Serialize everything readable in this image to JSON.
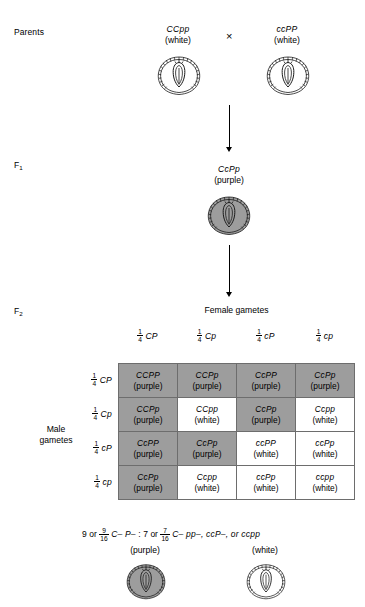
{
  "figure": {
    "type": "punnett-square-dihybrid-cross"
  },
  "generations": {
    "parents_label": "Parents",
    "f1_label": "F",
    "f1_sub": "1",
    "f2_label": "F",
    "f2_sub": "2"
  },
  "parents": {
    "left": {
      "genotype": "CCpp",
      "phenotype": "(white)",
      "shaded": false
    },
    "cross_symbol": "×",
    "right": {
      "genotype": "ccPP",
      "phenotype": "(white)",
      "shaded": false
    }
  },
  "f1": {
    "genotype": "CcPp",
    "phenotype": "(purple)",
    "shaded": true
  },
  "punnett": {
    "column_axis_title": "Female gametes",
    "row_axis_title_line1": "Male",
    "row_axis_title_line2": "gametes",
    "fraction_numerator": "1",
    "fraction_denominator": "4",
    "column_gametes": [
      "CP",
      "Cp",
      "cP",
      "cp"
    ],
    "row_gametes": [
      "CP",
      "Cp",
      "cP",
      "cp"
    ],
    "cells": [
      [
        {
          "genotype": "CCPP",
          "phenotype": "(purple)",
          "shaded": true
        },
        {
          "genotype": "CCPp",
          "phenotype": "(purple)",
          "shaded": true
        },
        {
          "genotype": "CcPP",
          "phenotype": "(purple)",
          "shaded": true
        },
        {
          "genotype": "CcPp",
          "phenotype": "(purple)",
          "shaded": true
        }
      ],
      [
        {
          "genotype": "CCPp",
          "phenotype": "(purple)",
          "shaded": true
        },
        {
          "genotype": "CCpp",
          "phenotype": "(white)",
          "shaded": false
        },
        {
          "genotype": "CcPp",
          "phenotype": "(purple)",
          "shaded": true
        },
        {
          "genotype": "Ccpp",
          "phenotype": "(white)",
          "shaded": false
        }
      ],
      [
        {
          "genotype": "CcPP",
          "phenotype": "(purple)",
          "shaded": true
        },
        {
          "genotype": "CcPp",
          "phenotype": "(purple)",
          "shaded": true
        },
        {
          "genotype": "ccPP",
          "phenotype": "(white)",
          "shaded": false
        },
        {
          "genotype": "ccPp",
          "phenotype": "(white)",
          "shaded": false
        }
      ],
      [
        {
          "genotype": "CcPp",
          "phenotype": "(purple)",
          "shaded": true
        },
        {
          "genotype": "Ccpp",
          "phenotype": "(white)",
          "shaded": false
        },
        {
          "genotype": "ccPp",
          "phenotype": "(white)",
          "shaded": false
        },
        {
          "genotype": "ccpp",
          "phenotype": "(white)",
          "shaded": false
        }
      ]
    ]
  },
  "summary": {
    "purple_count": "9",
    "purple_or": "or",
    "purple_num": "9",
    "purple_den": "16",
    "purple_genotypes": "C– P–",
    "separator": ":",
    "white_count": "7",
    "white_or": "or",
    "white_num": "7",
    "white_den": "16",
    "white_genotypes": "C– pp–, ccP–, or ccpp",
    "purple_phenotype": "(purple)",
    "white_phenotype": "(white)"
  },
  "colors": {
    "shaded_cell": "#9d9d9d",
    "plain_cell": "#ffffff",
    "grid_border": "#6d6d6d",
    "text": "#000000",
    "kernel_shaded_fill": "#9d9d9d",
    "kernel_plain_fill": "#ffffff"
  },
  "icons": {
    "kernel": "flower-cross-section-icon",
    "arrow": "down-arrow-icon",
    "cross": "cross-multiply-icon"
  }
}
